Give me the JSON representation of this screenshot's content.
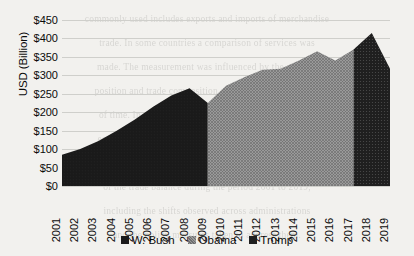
{
  "chart_data": {
    "type": "area",
    "title": "",
    "subtitle": "",
    "xlabel": "",
    "ylabel": "USD (Billion)",
    "ylim": [
      0,
      450
    ],
    "xlim": [
      2001,
      2019
    ],
    "grid": true,
    "legend_position": "bottom",
    "yticks": [
      0,
      50,
      100,
      150,
      200,
      250,
      300,
      350,
      400,
      450
    ],
    "ytick_labels": [
      "$0",
      "$50",
      "$100",
      "$150",
      "$200",
      "$250",
      "$300",
      "$350",
      "$400",
      "$450"
    ],
    "categories": [
      "2001",
      "2002",
      "2003",
      "2004",
      "2005",
      "2006",
      "2007",
      "2008",
      "2009",
      "2010",
      "2011",
      "2012",
      "2013",
      "2014",
      "2015",
      "2016",
      "2017",
      "2018",
      "2019"
    ],
    "x": [
      2001,
      2002,
      2003,
      2004,
      2005,
      2006,
      2007,
      2008,
      2009,
      2010,
      2011,
      2012,
      2013,
      2014,
      2015,
      2016,
      2017,
      2018,
      2019
    ],
    "values": [
      85,
      100,
      122,
      150,
      180,
      215,
      245,
      265,
      225,
      272,
      295,
      315,
      318,
      340,
      365,
      340,
      370,
      415,
      318
    ],
    "series": [
      {
        "name": "W. Bush",
        "fill": "#1a1a1a",
        "pattern": "solid",
        "x": [
          2001,
          2002,
          2003,
          2004,
          2005,
          2006,
          2007,
          2008,
          2009
        ],
        "values": [
          85,
          100,
          122,
          150,
          180,
          215,
          245,
          265,
          225
        ]
      },
      {
        "name": "Obama",
        "fill": "#8f8f8f",
        "pattern": "crosshatch",
        "x": [
          2009,
          2010,
          2011,
          2012,
          2013,
          2014,
          2015,
          2016,
          2017
        ],
        "values": [
          225,
          272,
          295,
          315,
          318,
          340,
          365,
          340,
          370
        ]
      },
      {
        "name": "Trump",
        "fill": "#1f1f1f",
        "pattern": "dotted",
        "x": [
          2017,
          2018,
          2019
        ],
        "values": [
          370,
          415,
          318
        ]
      }
    ],
    "colors": {
      "bush": "#1a1a1a",
      "obama": "#8f8f8f",
      "trump": "#1f1f1f",
      "gridline": "#cfcfcb",
      "axis": "#4a4a4a",
      "text": "#0b0b0b",
      "background": "#f2f1ee"
    }
  },
  "legend": {
    "entries": [
      {
        "label": "W. Bush"
      },
      {
        "label": "Obama"
      },
      {
        "label": "Trump"
      }
    ]
  },
  "background_text": {
    "lines": [
      "commonly used includes exports and imports of merchandise",
      "trade. In some countries a comparison of services was",
      "made. The measurement was influenced by the country",
      "position and trade composition over the observed period",
      "of time. In the following chapters we focus on a set of",
      "economic indicators that reflect bilateral exchange and",
      "the relative weight of partners in the overall structure",
      "of the trade balance during the period 2001 to 2019,",
      "including the shifts observed across administrations",
      "and the policy measures taken to address them."
    ]
  }
}
